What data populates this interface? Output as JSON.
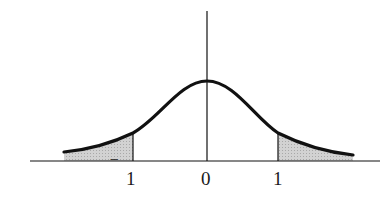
{
  "figure": {
    "type": "normal distribution curve with shaded tails",
    "x_labels": [
      {
        "value": -1,
        "text": "1",
        "prefix": "‾"
      },
      {
        "value": 0,
        "text": "0"
      },
      {
        "value": 1,
        "text": "1"
      }
    ],
    "shaded_regions": [
      "x < -1",
      "x > 1"
    ],
    "colors": {
      "line": "#111111",
      "shade": "#c8c8c8",
      "background": "#ffffff"
    }
  }
}
